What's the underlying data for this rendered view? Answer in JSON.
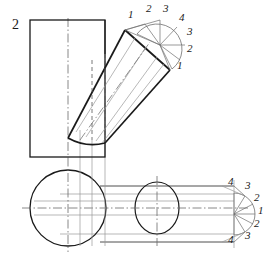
{
  "drawing": {
    "title_label": "2",
    "description": "Descriptive-geometry construction: intersection of an inclined cylinder with a vertical prism (front view) and with a horizontal cylinder (top view)",
    "colors": {
      "outline": "#1a1a1a",
      "thin_line": "#555555",
      "construction_line": "#888888",
      "center_line": "#666666",
      "background": "#ffffff"
    },
    "views": {
      "front": {
        "name": "front-view",
        "prism": {
          "x": 30,
          "y": 20,
          "width": 75,
          "height": 137
        },
        "inclined_cylinder": {
          "angle_label": "inclined",
          "top_face_corners": [
            [
              125,
              30
            ],
            [
              160,
              45
            ],
            [
              170,
              70
            ],
            [
              135,
              55
            ]
          ]
        }
      },
      "top": {
        "name": "top-view",
        "left_circle": {
          "cx": 68,
          "cy": 208,
          "r": 38
        },
        "mid_ellipse": {
          "cx": 157,
          "cy": 208,
          "rx": 22,
          "ry": 26
        },
        "horizontal_cylinder": {
          "x1": 100,
          "x2": 234,
          "y_top": 186,
          "y_bot": 242
        }
      }
    },
    "auxiliary_semicircle_top": {
      "name": "auxiliary-semicircle-upper",
      "center": [
        160,
        45
      ],
      "radius": 25,
      "division_labels": [
        "1",
        "2",
        "3",
        "4",
        "3",
        "2",
        "1"
      ]
    },
    "auxiliary_semicircle_bottom": {
      "name": "auxiliary-semicircle-lower",
      "center": [
        234,
        214
      ],
      "radius": 21,
      "division_labels": [
        "4",
        "3",
        "2",
        "1",
        "2",
        "3",
        "4"
      ]
    },
    "labels_top": [
      {
        "text": "1",
        "x": 128,
        "y": 14
      },
      {
        "text": "2",
        "x": 146,
        "y": 8
      },
      {
        "text": "3",
        "x": 163,
        "y": 8
      },
      {
        "text": "4",
        "x": 179,
        "y": 17
      },
      {
        "text": "3",
        "x": 186,
        "y": 31
      },
      {
        "text": "2",
        "x": 186,
        "y": 48
      },
      {
        "text": "1",
        "x": 177,
        "y": 64
      }
    ],
    "labels_bottom": [
      {
        "text": "4",
        "x": 228,
        "y": 181
      },
      {
        "text": "3",
        "x": 245,
        "y": 185
      },
      {
        "text": "2",
        "x": 254,
        "y": 197
      },
      {
        "text": "1",
        "x": 258,
        "y": 209
      },
      {
        "text": "2",
        "x": 254,
        "y": 222
      },
      {
        "text": "3",
        "x": 245,
        "y": 234
      },
      {
        "text": "4",
        "x": 228,
        "y": 238
      }
    ],
    "labels_misc": [
      {
        "text": "2",
        "x": 12,
        "y": 24,
        "size": "big"
      }
    ]
  }
}
